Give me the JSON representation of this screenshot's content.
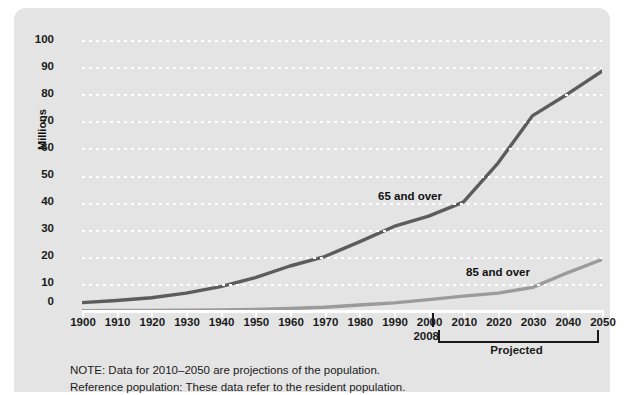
{
  "chart_data": {
    "type": "line",
    "title": "",
    "xlabel": "",
    "ylabel": "Millions",
    "xlim": [
      1900,
      2050
    ],
    "ylim": [
      0,
      100
    ],
    "grid": true,
    "legend_position": "inline-annotation",
    "x": [
      1900,
      1910,
      1920,
      1930,
      1940,
      1950,
      1960,
      1970,
      1980,
      1990,
      2000,
      2010,
      2020,
      2030,
      2040,
      2050
    ],
    "series": [
      {
        "name": "65 and over",
        "color": "#5c5c5c",
        "values": [
          3.1,
          3.9,
          4.9,
          6.6,
          9.0,
          12.3,
          16.6,
          20.1,
          25.5,
          31.2,
          35.0,
          40.2,
          54.6,
          72.1,
          80.0,
          88.5
        ]
      },
      {
        "name": "85 and over",
        "color": "#9b9b9b",
        "values": [
          0.1,
          0.2,
          0.2,
          0.3,
          0.4,
          0.6,
          0.9,
          1.4,
          2.2,
          3.0,
          4.2,
          5.5,
          6.6,
          8.7,
          14.1,
          19.0
        ]
      }
    ],
    "yticks": [
      0,
      10,
      20,
      30,
      40,
      50,
      60,
      70,
      80,
      90,
      100
    ],
    "xticks": [
      1900,
      1910,
      1920,
      1930,
      1940,
      1950,
      1960,
      1970,
      1980,
      1990,
      2000,
      2010,
      2020,
      2030,
      2040,
      2050
    ],
    "annotations": [
      {
        "name": "2008-marker",
        "text": "2008",
        "x": 2008
      },
      {
        "name": "projected-bracket",
        "text": "Projected",
        "x_start": 2010,
        "x_end": 2050
      }
    ]
  },
  "axis": {
    "y_title": "Millions",
    "y_ticks": [
      "100",
      "90",
      "80",
      "70",
      "60",
      "50",
      "40",
      "30",
      "20",
      "10",
      "0"
    ],
    "x_ticks": [
      "1900",
      "1910",
      "1920",
      "1930",
      "1940",
      "1950",
      "1960",
      "1970",
      "1980",
      "1990",
      "2000",
      "2010",
      "2020",
      "2030",
      "2040",
      "2050"
    ]
  },
  "labels": {
    "series_65": "65 and over",
    "series_85": "85 and over",
    "year_2008": "2008",
    "projected": "Projected"
  },
  "notes": {
    "line1": "NOTE: Data for 2010–2050 are projections of the population.",
    "line2": "Reference population: These data refer to the resident population."
  },
  "colors": {
    "panel_background": "#e4e4e4",
    "page_background": "#ffffff",
    "gridline": "#ffffff",
    "series_65_line": "#5c5c5c",
    "series_85_line": "#9b9b9b",
    "text": "#1a1a1a"
  }
}
